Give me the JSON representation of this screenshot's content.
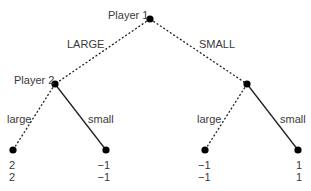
{
  "diagram": {
    "type": "extensive-form game tree",
    "nodes": {
      "root": {
        "label": "Player 1",
        "x": 150,
        "y": 19
      },
      "p2_left": {
        "label": "Player 2",
        "x": 55,
        "y": 84
      },
      "p2_right": {
        "label": "",
        "x": 247,
        "y": 84
      },
      "leaf_1": {
        "x": 13,
        "y": 150,
        "payoffs": [
          "2",
          "2"
        ]
      },
      "leaf_2": {
        "x": 106,
        "y": 150,
        "payoffs": [
          "−1",
          "−1"
        ]
      },
      "leaf_3": {
        "x": 205,
        "y": 150,
        "payoffs": [
          "−1",
          "−1"
        ]
      },
      "leaf_4": {
        "x": 298,
        "y": 150,
        "payoffs": [
          "1",
          "1"
        ]
      }
    },
    "edges": [
      {
        "from": "root",
        "to": "p2_left",
        "label": "LARGE",
        "style": "dotted"
      },
      {
        "from": "root",
        "to": "p2_right",
        "label": "SMALL",
        "style": "dotted"
      },
      {
        "from": "p2_left",
        "to": "leaf_1",
        "label": "large",
        "style": "dotted"
      },
      {
        "from": "p2_left",
        "to": "leaf_2",
        "label": "small",
        "style": "solid"
      },
      {
        "from": "p2_right",
        "to": "leaf_3",
        "label": "large",
        "style": "dotted"
      },
      {
        "from": "p2_right",
        "to": "leaf_4",
        "label": "small",
        "style": "solid"
      }
    ],
    "colors": {
      "line": "#222222",
      "node": "#000000",
      "text": "#3a3a3a"
    }
  }
}
